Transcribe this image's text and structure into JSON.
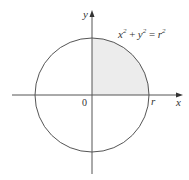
{
  "diagram": {
    "equation": "x² + y² = r²",
    "eq_base_x": "x",
    "eq_base_y": "y",
    "eq_base_r": "r",
    "eq_exp": "2",
    "eq_plus": "+",
    "eq_equals": "=",
    "x_axis_label": "x",
    "y_axis_label": "y",
    "origin_label": "0",
    "radius_label": "r",
    "shaded_region": "first quadrant of disk",
    "colors": {
      "shade": "#ececec",
      "stroke": "#555555"
    }
  }
}
